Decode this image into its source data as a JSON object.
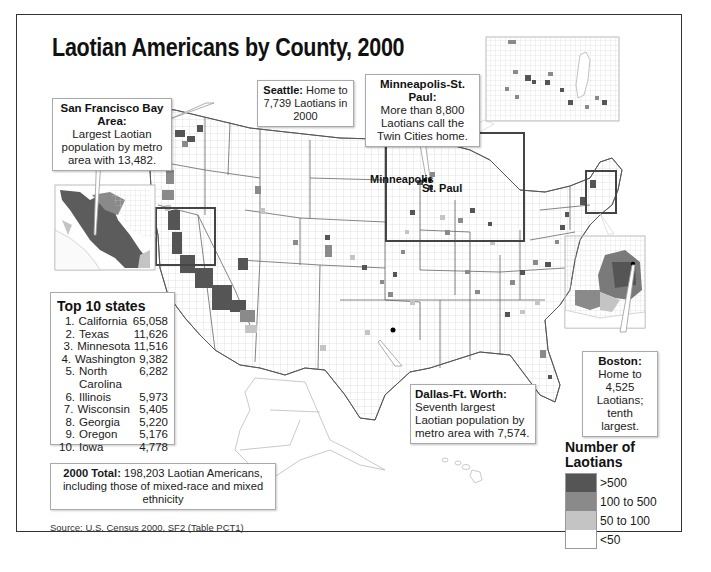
{
  "title": "Laotian Americans by County, 2000",
  "callouts": {
    "sf": {
      "heading": "San Francisco Bay Area:",
      "body": "Largest Laotian population by metro area with 13,482."
    },
    "seattle": {
      "heading": "Seattle:",
      "body": "Home to 7,739 Laotians in 2000"
    },
    "minneapolis": {
      "heading": "Minneapolis-St. Paul:",
      "body": "More than 8,800 Laotians call the Twin Cities home."
    },
    "dallas": {
      "heading": "Dallas-Ft. Worth:",
      "body": "Seventh largest Laotian population by metro area with 7,574."
    },
    "boston": {
      "heading": "Boston:",
      "body": "Home to 4,525 Laotians; tenth largest."
    }
  },
  "city_labels": {
    "minneapolis": "Minneapolis",
    "st_paul": "St. Paul"
  },
  "top10": {
    "heading": "Top 10 states",
    "rows": [
      {
        "rank": "1.",
        "state": "California",
        "value": "65,058"
      },
      {
        "rank": "2.",
        "state": "Texas",
        "value": "11,626"
      },
      {
        "rank": "3.",
        "state": "Minnesota",
        "value": "11,516"
      },
      {
        "rank": "4.",
        "state": "Washington",
        "value": "9,382"
      },
      {
        "rank": "5.",
        "state": "North Carolina",
        "value": "6,282"
      },
      {
        "rank": "6.",
        "state": "Illinois",
        "value": "5,973"
      },
      {
        "rank": "7.",
        "state": "Wisconsin",
        "value": "5,405"
      },
      {
        "rank": "8.",
        "state": "Georgia",
        "value": "5,220"
      },
      {
        "rank": "9.",
        "state": "Oregon",
        "value": "5,176"
      },
      {
        "rank": "10.",
        "state": "Iowa",
        "value": "4,778"
      }
    ]
  },
  "total": {
    "heading": "2000 Total:",
    "body": "198,203 Laotian Americans, including those of mixed-race and mixed ethnicity"
  },
  "source": "Source: U.S. Census 2000, SF2 (Table PCT1)",
  "legend": {
    "title_line1": "Number of",
    "title_line2": "Laotians",
    "items": [
      {
        "label": ">500",
        "color": "#555555"
      },
      {
        "label": "100 to 500",
        "color": "#8a8a8a"
      },
      {
        "label": "50 to 100",
        "color": "#c4c4c4"
      },
      {
        "label": "<50",
        "color": "#ffffff"
      }
    ]
  }
}
